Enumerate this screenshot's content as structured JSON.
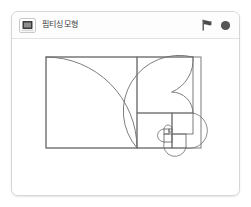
{
  "window": {
    "title": "핌티싱모형"
  },
  "header": {
    "project_icon_name": "project-thumbnail-icon",
    "title": "핌티싱모형",
    "controls": [
      {
        "name": "green-flag-button",
        "label": "Go",
        "color": "#4a4a4a"
      },
      {
        "name": "stop-button",
        "label": "Stop",
        "color": "#555555"
      }
    ]
  },
  "colors": {
    "card_border": "#d6d6d6",
    "header_rule": "#e3e3e3",
    "stage_background": "#ffffff",
    "stroke": "#6e6e6e",
    "flag": "#4a4a4a",
    "stop": "#555555"
  },
  "stage": {
    "name": "project-stage",
    "drawing_name": "fibonacci-golden-spiral",
    "description": "Fibonacci golden spiral inscribed in a golden rectangle with nested squares",
    "rectangle": {
      "x": 34,
      "y": 18,
      "width": 155,
      "height": 91
    },
    "squares": [
      {
        "index": 1,
        "size": 91,
        "x": 34,
        "y": 18
      },
      {
        "index": 2,
        "size": 56,
        "x": 125,
        "y": 18
      },
      {
        "index": 3,
        "size": 35,
        "x": 125,
        "y": 74
      },
      {
        "index": 4,
        "size": 21,
        "x": 160,
        "y": 74
      },
      {
        "index": 5,
        "size": 14,
        "x": 160,
        "y": 95
      },
      {
        "index": 6,
        "size": 8,
        "x": 152,
        "y": 95
      },
      {
        "index": 7,
        "size": 5,
        "x": 152,
        "y": 90
      },
      {
        "index": 8,
        "size": 3,
        "x": 157,
        "y": 90
      }
    ],
    "arcs": [
      {
        "index": 1,
        "radius": 91,
        "from": [
          34,
          18
        ],
        "to": [
          125,
          109
        ],
        "center": [
          125,
          18
        ]
      },
      {
        "index": 2,
        "radius": 56,
        "from": [
          125,
          109
        ],
        "to": [
          181,
          18
        ],
        "center": [
          125,
          18
        ]
      },
      {
        "index": 3,
        "radius": 35,
        "from": [
          181,
          18
        ],
        "to": [
          160,
          53
        ],
        "center": [
          181,
          53
        ]
      },
      {
        "index": 4,
        "radius": 21,
        "from": [
          160,
          53
        ],
        "to": [
          181,
          74
        ],
        "center": [
          160,
          74
        ]
      }
    ]
  }
}
